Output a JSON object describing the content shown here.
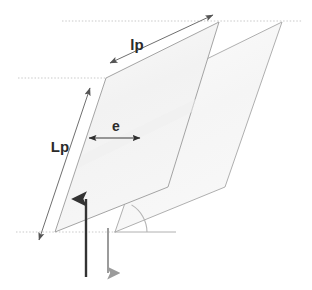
{
  "figure": {
    "background_color": "#ffffff"
  },
  "labels": {
    "lp": "lp",
    "Lp": "Lp",
    "e": "e"
  },
  "colors": {
    "outline": "#9a9a9a",
    "fill_front": "#f4f4f4",
    "fill_back": "#f7f7f7",
    "dotted_reference": "#c9c9c9",
    "baseline_solid": "#b0b0b0",
    "dimension_line": "#7d7d7d",
    "arrow_up": "#333333",
    "arrow_down": "#9b9b9b",
    "arc": "#b5b5b5",
    "text": "#2b2b2b"
  },
  "shapes": {
    "front_plate": {
      "name": "front-parallelogram",
      "points": "106,78 219,22 168,187 55,232"
    },
    "back_plate": {
      "name": "back-parallelogram",
      "points": "168,78 282,22 225,187 115,232"
    }
  },
  "reference_lines": {
    "top_dotted": {
      "x1": 62,
      "y1": 21,
      "x2": 302,
      "y2": 21
    },
    "middle_dotted": {
      "x1": 18,
      "y1": 78,
      "x2": 226,
      "y2": 78
    },
    "bottom_dotted": {
      "x1": 16,
      "y1": 232,
      "x2": 116,
      "y2": 232
    },
    "bottom_solid": {
      "x1": 115,
      "y1": 232,
      "x2": 176,
      "y2": 232
    }
  },
  "dimensions": [
    {
      "id": "lp",
      "label": "lp",
      "description": "plate length along top inclined edge",
      "x1": 110,
      "y1": 63,
      "x2": 213,
      "y2": 15,
      "label_x": 137,
      "label_y": 50,
      "arrows": "both"
    },
    {
      "id": "Lp",
      "label": "Lp",
      "description": "plate height along left inclined edge",
      "x1": 39,
      "y1": 240,
      "x2": 90,
      "y2": 88,
      "label_x": 60,
      "label_y": 150,
      "arrows": "both"
    },
    {
      "id": "e",
      "label": "e",
      "description": "horizontal spacing between plates",
      "x1": 88,
      "y1": 138,
      "x2": 141,
      "y2": 138,
      "label_x": 115,
      "label_y": 132,
      "arrows": "both"
    }
  ],
  "angle_marker": {
    "name": "inclination-angle-arc",
    "vertex_x": 115,
    "vertex_y": 232,
    "radius": 32
  },
  "flow_arrows": [
    {
      "id": "up-flow",
      "direction": "up",
      "color": "#333333",
      "x": 86,
      "y_start": 277,
      "y_end": 196,
      "width": 2.4
    },
    {
      "id": "down-flow",
      "direction": "down",
      "color": "#9b9b9b",
      "x": 108,
      "y_start": 228,
      "y_end": 276,
      "width": 2.0
    }
  ]
}
